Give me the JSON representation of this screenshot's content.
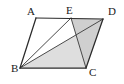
{
  "figure": {
    "type": "geometry-diagram",
    "shape": "parallelogram",
    "background_color": "#ffffff",
    "outline_color": "#2b2b2b",
    "inner_line_color": "#4a4a4a",
    "shade_color": "#dedede",
    "shade_color_dark": "#cfcfcf",
    "labels": {
      "a": "A",
      "b": "B",
      "c": "C",
      "d": "D",
      "e": "E"
    },
    "points": {
      "A": {
        "x": 36,
        "y": 18
      },
      "B": {
        "x": 20,
        "y": 68
      },
      "C": {
        "x": 86,
        "y": 68
      },
      "D": {
        "x": 103,
        "y": 19
      },
      "E": {
        "x": 71,
        "y": 18
      }
    },
    "label_positions": {
      "A": {
        "x": 27,
        "y": 15
      },
      "B": {
        "x": 11,
        "y": 72
      },
      "C": {
        "x": 89,
        "y": 76
      },
      "D": {
        "x": 108,
        "y": 15
      },
      "E": {
        "x": 66,
        "y": 14
      }
    },
    "edges": [
      {
        "name": "AB",
        "from": "A",
        "to": "B",
        "style": "outline"
      },
      {
        "name": "BC",
        "from": "B",
        "to": "C",
        "style": "outline"
      },
      {
        "name": "CD",
        "from": "C",
        "to": "D",
        "style": "outline"
      },
      {
        "name": "DA",
        "from": "D",
        "to": "A",
        "style": "outline"
      }
    ],
    "segments": [
      {
        "name": "BE",
        "from": "B",
        "to": "E",
        "style": "inner"
      },
      {
        "name": "BD",
        "from": "B",
        "to": "D",
        "style": "inner"
      },
      {
        "name": "EC",
        "from": "E",
        "to": "C",
        "style": "inner"
      }
    ],
    "shaded_regions": [
      {
        "name": "triangle-BDC",
        "vertices": [
          "B",
          "D",
          "C"
        ],
        "color": "#dedede"
      },
      {
        "name": "triangle-EDC",
        "vertices": [
          "E",
          "D",
          "C"
        ],
        "color": "#cfcfcf"
      }
    ]
  }
}
